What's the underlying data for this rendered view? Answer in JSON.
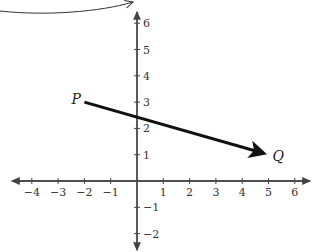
{
  "diagram": {
    "type": "coordinate-plane-vector",
    "x_axis": {
      "min": -4,
      "max": 6,
      "tick_labels": [
        "-4",
        "-3",
        "-2",
        "-1",
        "1",
        "2",
        "3",
        "4",
        "5",
        "6"
      ]
    },
    "y_axis": {
      "min": -2,
      "max": 6,
      "tick_labels": [
        "6",
        "5",
        "4",
        "3",
        "2",
        "1",
        "-1",
        "-2"
      ]
    },
    "points": [
      {
        "label": "P",
        "x": -2,
        "y": 3
      },
      {
        "label": "Q",
        "x": 5,
        "y": 1
      }
    ],
    "vector": {
      "from": "P",
      "to": "Q"
    },
    "annotation": "curved arrow from text above (cropped) pointing toward the y-axis"
  },
  "colors": {
    "axis": "#444444",
    "vector": "#111111",
    "text": "#333333"
  }
}
